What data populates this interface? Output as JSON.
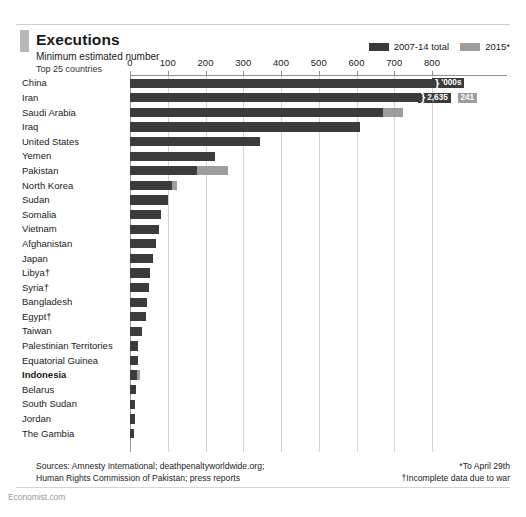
{
  "header": {
    "title": "Executions",
    "subtitle": "Minimum estimated number",
    "subtitle2": "Top 25 countries"
  },
  "legend": {
    "items": [
      {
        "label": "2007-14 total",
        "color": "#3b3b3b"
      },
      {
        "label": "2015*",
        "color": "#9d9d9d"
      }
    ]
  },
  "footer": {
    "sources_line1": "Sources: Amnesty International; deathpenaltyworldwide.org;",
    "sources_line2": "Human Rights Commission of Pakistan; press reports",
    "note1": "*To April 29th",
    "note2": "†Incomplete data due to war",
    "brand": "Economist.com"
  },
  "chart_data": {
    "type": "bar",
    "orientation": "horizontal",
    "stacked": true,
    "title": "Executions",
    "subtitle": "Minimum estimated number",
    "xlabel": "",
    "ylabel": "",
    "xlim": [
      0,
      800
    ],
    "xticks": [
      0,
      100,
      200,
      300,
      400,
      500,
      600,
      700,
      800
    ],
    "ticklabels": [
      "0",
      "100",
      "200",
      "300",
      "400",
      "500",
      "600",
      "700",
      "800"
    ],
    "grid": true,
    "legend_position": "top-right",
    "legend_entries": [
      "2007-14 total",
      "2015*"
    ],
    "categories": [
      "China",
      "Iran",
      "Saudi Arabia",
      "Iraq",
      "United States",
      "Yemen",
      "Pakistan",
      "North Korea",
      "Sudan",
      "Somalia",
      "Vietnam",
      "Afghanistan",
      "Japan",
      "Libya†",
      "Syria†",
      "Bangladesh",
      "Egypt†",
      "Taiwan",
      "Palestinian Territories",
      "Equatorial Guinea",
      "Indonesia",
      "Belarus",
      "South Sudan",
      "Jordan",
      "The Gambia"
    ],
    "series": [
      {
        "name": "2007-14 total",
        "color": "#3b3b3b",
        "values": [
          900,
          840,
          670,
          610,
          345,
          225,
          178,
          110,
          100,
          83,
          78,
          70,
          60,
          52,
          50,
          46,
          42,
          32,
          22,
          20,
          18,
          16,
          14,
          12,
          10
        ]
      },
      {
        "name": "2015*",
        "color": "#9d9d9d",
        "values": [
          0,
          30,
          53,
          0,
          0,
          0,
          82,
          15,
          0,
          0,
          0,
          0,
          0,
          0,
          0,
          0,
          0,
          0,
          0,
          0,
          8,
          0,
          0,
          0,
          0
        ]
      }
    ],
    "truncated_rows": [
      "China",
      "Iran"
    ],
    "data_labels": [
      {
        "category": "China",
        "series": "2007-14 total",
        "text": "'000s"
      },
      {
        "category": "Iran",
        "series": "2007-14 total",
        "text": "2,635"
      },
      {
        "category": "Iran",
        "series": "2015*",
        "text": "241"
      }
    ],
    "highlighted_category": "Indonesia"
  }
}
